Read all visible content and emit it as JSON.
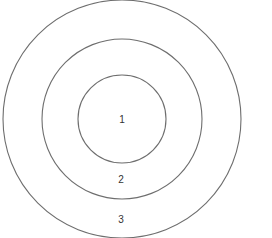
{
  "diagram": {
    "type": "concentric-circles",
    "center": {
      "x": 122,
      "y": 119
    },
    "stroke_color": "#6e6e6e",
    "label_color": "#333333",
    "rings": [
      {
        "id": "ring-1",
        "label": "1",
        "radius": 44,
        "label_x": 122,
        "label_y": 120
      },
      {
        "id": "ring-2",
        "label": "2",
        "radius": 80,
        "label_x": 121,
        "label_y": 180
      },
      {
        "id": "ring-3",
        "label": "3",
        "radius": 119,
        "label_x": 121,
        "label_y": 220
      }
    ]
  }
}
